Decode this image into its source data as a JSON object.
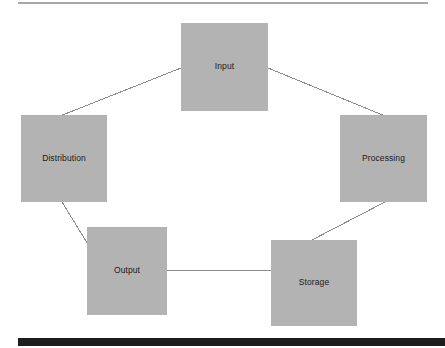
{
  "diagram": {
    "type": "cycle-flow-diagram",
    "background_color": "#ffffff",
    "node_fill_color": "#b3b3b3",
    "node_text_color": "#1a1a1a",
    "connector_color": "#8c8c8c",
    "top_rule_color": "#a8a8a8",
    "bottom_bar_color": "#1d1d1d",
    "nodes": [
      {
        "id": "input",
        "label": "Input",
        "x": 181,
        "y": 23,
        "w": 87,
        "h": 88
      },
      {
        "id": "distribution",
        "label": "Distribution",
        "x": 21,
        "y": 115,
        "w": 86,
        "h": 87
      },
      {
        "id": "processing",
        "label": "Processing",
        "x": 340,
        "y": 115,
        "w": 87,
        "h": 87
      },
      {
        "id": "output",
        "label": "Output",
        "x": 87,
        "y": 227,
        "w": 80,
        "h": 88
      },
      {
        "id": "storage",
        "label": "Storage",
        "x": 271,
        "y": 240,
        "w": 86,
        "h": 86
      }
    ],
    "connectors": [
      {
        "id": "distribution-to-input",
        "from": "distribution",
        "to": "input",
        "x1": 60,
        "y1": 116,
        "x2": 181,
        "y2": 68
      },
      {
        "id": "input-to-processing",
        "from": "input",
        "to": "processing",
        "x1": 268,
        "y1": 68,
        "x2": 385,
        "y2": 116
      },
      {
        "id": "processing-to-storage",
        "from": "processing",
        "to": "storage",
        "x1": 385,
        "y1": 202,
        "x2": 310,
        "y2": 241
      },
      {
        "id": "output-to-storage",
        "from": "output",
        "to": "storage",
        "x1": 167,
        "y1": 270,
        "x2": 271,
        "y2": 270
      },
      {
        "id": "distribution-to-output",
        "from": "distribution",
        "to": "output",
        "x1": 62,
        "y1": 202,
        "x2": 89,
        "y2": 246
      }
    ]
  }
}
